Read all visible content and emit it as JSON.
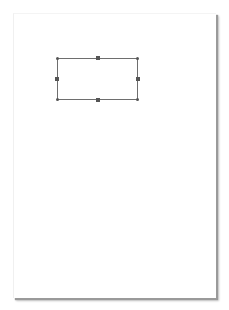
{
  "document": {
    "page": {
      "background": "#ffffff",
      "shadow_color": "#9a9a9a"
    },
    "selected_shape": {
      "type": "rectangle",
      "stroke_color": "#6e6e6e",
      "handle_color": "#555555",
      "handles": [
        "top-left",
        "top-middle",
        "top-right",
        "middle-left",
        "middle-right",
        "bottom-left",
        "bottom-middle",
        "bottom-right"
      ]
    }
  }
}
